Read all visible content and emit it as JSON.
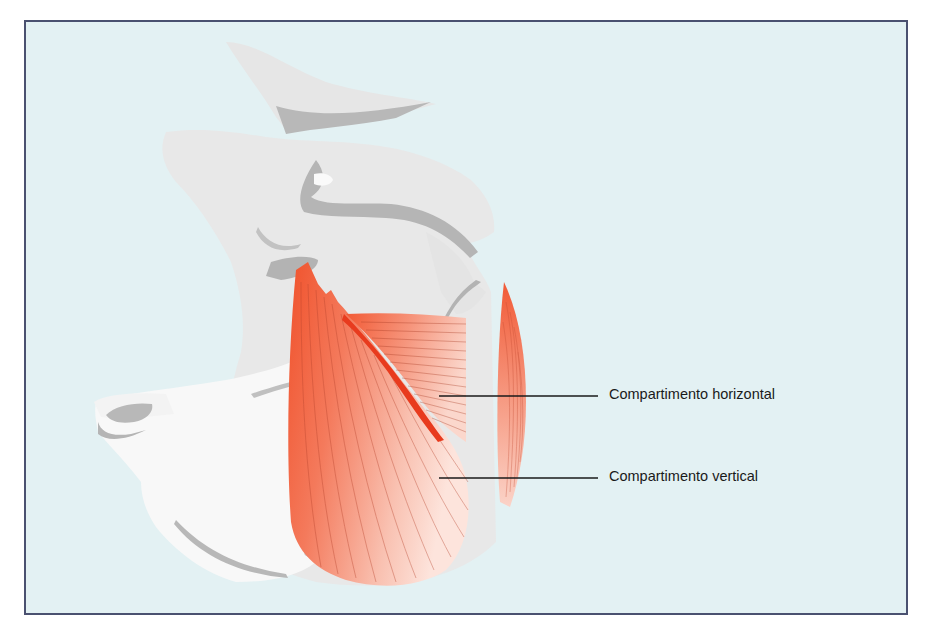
{
  "figure": {
    "title": "",
    "labels": [
      {
        "id": "horizontal",
        "text": "Compartimento horizontal"
      },
      {
        "id": "vertical",
        "text": "Compartimento vertical"
      }
    ]
  },
  "colors": {
    "background": "#e3f1f3",
    "frame_border": "#4a5170",
    "bone_light": "#e9e9e9",
    "bone_white": "#f7f7f7",
    "bone_shadow": "#b7b7b7",
    "muscle_deep": "#f0522c",
    "muscle_mid": "#f6866a",
    "muscle_light": "#fbd3c8",
    "leader_line": "#1a1a1a"
  }
}
